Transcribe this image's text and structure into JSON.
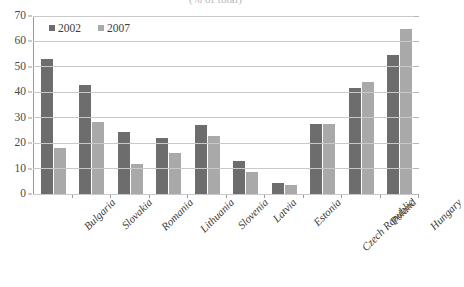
{
  "chart_data": {
    "type": "bar",
    "title": "(% of total)",
    "xlabel": "",
    "ylabel": "",
    "ylim": [
      0,
      70
    ],
    "yticks": [
      0,
      10,
      20,
      30,
      40,
      50,
      60,
      70
    ],
    "grid": true,
    "legend_position": "top-left",
    "categories": [
      "Bulgaria",
      "Slovakia",
      "Romania",
      "Lithuania",
      "Slovenia",
      "Latvia",
      "Estonia",
      "Czech Republic",
      "Poland",
      "Hungary"
    ],
    "series": [
      {
        "name": "2002",
        "color": "#6d6d6d",
        "values": [
          53,
          43,
          24.5,
          22,
          27,
          13,
          4.5,
          27.5,
          41.5,
          54.5
        ]
      },
      {
        "name": "2007",
        "color": "#a9a9a9",
        "values": [
          18,
          28.5,
          12,
          16,
          23,
          8.5,
          3.5,
          27.5,
          44,
          65
        ]
      }
    ]
  },
  "colors": {
    "series_2002": "#6d6d6d",
    "series_2007": "#a9a9a9",
    "gridline": "#c9c9c9",
    "axis": "#9a9a9a",
    "text": "#3a3a3a",
    "background": "#ffffff"
  }
}
